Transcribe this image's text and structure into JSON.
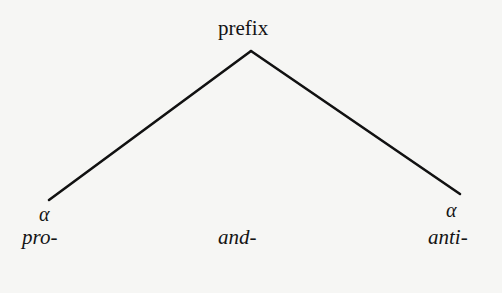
{
  "tree": {
    "root": {
      "label": "prefix"
    },
    "branches": [
      {
        "side": "left",
        "label": "α"
      },
      {
        "side": "right",
        "label": "α"
      }
    ],
    "leaves": [
      {
        "label": "pro-"
      },
      {
        "label": "and-"
      },
      {
        "label": "anti-"
      }
    ],
    "colors": {
      "line": "#111111",
      "background": "#f6f6f4"
    }
  }
}
